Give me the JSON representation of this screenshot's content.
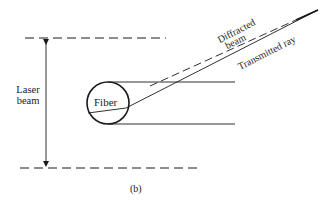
{
  "figure": {
    "caption": "(b)",
    "labels": {
      "laser_beam_line1": "Laser",
      "laser_beam_line2": "beam",
      "fiber": "Fiber",
      "diffracted_line1": "Diffracted",
      "diffracted_line2": "beam",
      "transmitted": "Transmitted ray"
    },
    "colors": {
      "stroke": "#1a1a1a",
      "background": "#ffffff"
    },
    "elements": {
      "top_boundary": {
        "style": "dashed",
        "y": 38,
        "x1": 25,
        "x2": 165
      },
      "bottom_boundary": {
        "style": "dashed",
        "y": 168,
        "x1": 20,
        "x2": 198
      },
      "laser_beam_arrow": {
        "x": 46,
        "y1": 38,
        "y2": 168,
        "direction": "double-headed"
      },
      "fiber_circle": {
        "cx": 108,
        "cy": 103,
        "r": 21
      },
      "tangent_top": {
        "y": 82,
        "x1": 108,
        "x2": 235
      },
      "tangent_bottom": {
        "y": 124,
        "x1": 108,
        "x2": 235
      },
      "transmitted_ray": {
        "style": "solid"
      },
      "diffracted_beam": {
        "style": "dashed"
      }
    }
  }
}
